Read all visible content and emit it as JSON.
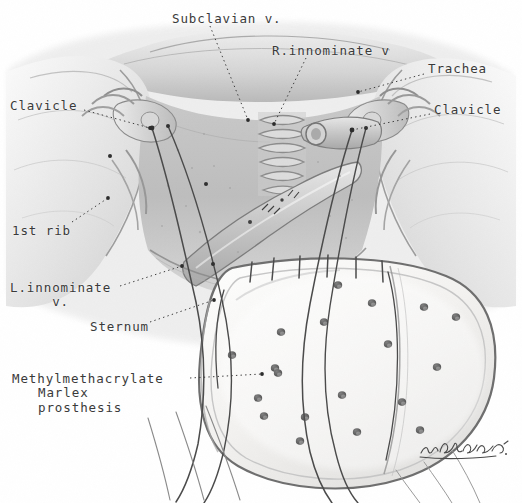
{
  "figure": {
    "medium": "grayscale pencil medical illustration",
    "background_color": "#ffffff",
    "ink_color": "#3a3a3a"
  },
  "labels": [
    {
      "id": "subclavian-v",
      "text": "Subclavian v.",
      "x": 172,
      "y": 12,
      "align": "left"
    },
    {
      "id": "r-innominate-v",
      "text": "R.innominate v",
      "x": 272,
      "y": 44,
      "align": "left"
    },
    {
      "id": "trachea",
      "text": "Trachea",
      "x": 428,
      "y": 62,
      "align": "left"
    },
    {
      "id": "clavicle-left",
      "text": "Clavicle",
      "x": 10,
      "y": 99,
      "align": "left"
    },
    {
      "id": "clavicle-right",
      "text": "Clavicle",
      "x": 434,
      "y": 103,
      "align": "left"
    },
    {
      "id": "first-rib",
      "text": "1st rib",
      "x": 12,
      "y": 224,
      "align": "left"
    },
    {
      "id": "l-innominate-v",
      "text": "L.innominate\n     v.",
      "x": 10,
      "y": 281,
      "align": "left"
    },
    {
      "id": "sternum",
      "text": "Sternum",
      "x": 90,
      "y": 320,
      "align": "left"
    },
    {
      "id": "prosthesis",
      "text": "Methylmethacrylate\n   Marlex\n   prosthesis",
      "x": 12,
      "y": 372,
      "align": "left"
    }
  ],
  "label_text": {
    "subclavian_v": "Subclavian v.",
    "r_innominate_v": "R.innominate v",
    "trachea": "Trachea",
    "clavicle_left": "Clavicle",
    "clavicle_right": "Clavicle",
    "first_rib": "1st rib",
    "l_innominate_v_line1": "L.innominate",
    "l_innominate_v_line2": "v.",
    "sternum": "Sternum",
    "prosthesis_line1": "Methylmethacrylate",
    "prosthesis_line2": "Marlex",
    "prosthesis_line3": "prosthesis"
  },
  "leader_lines": [
    {
      "id": "subclavian-leader",
      "from": [
        210,
        26
      ],
      "to": [
        248,
        120
      ],
      "style": "dotted"
    },
    {
      "id": "innominate-leader",
      "from": [
        306,
        58
      ],
      "to": [
        274,
        124
      ],
      "style": "dotted"
    },
    {
      "id": "trachea-leader",
      "from": [
        424,
        74
      ],
      "to": [
        358,
        92
      ],
      "style": "dotted"
    },
    {
      "id": "clavicle-left-leader",
      "from": [
        84,
        110
      ],
      "to": [
        150,
        128
      ],
      "style": "dotted"
    },
    {
      "id": "clavicle-right-leader",
      "from": [
        430,
        114
      ],
      "to": [
        352,
        130
      ],
      "style": "dotted"
    },
    {
      "id": "first-rib-leader",
      "from": [
        72,
        222
      ],
      "to": [
        108,
        198
      ],
      "style": "dotted"
    },
    {
      "id": "l-innominate-leader",
      "from": [
        120,
        286
      ],
      "to": [
        182,
        266
      ],
      "style": "dotted"
    },
    {
      "id": "sternum-leader",
      "from": [
        150,
        322
      ],
      "to": [
        214,
        300
      ],
      "style": "dotted"
    },
    {
      "id": "prosthesis-leader",
      "from": [
        190,
        378
      ],
      "to": [
        262,
        374
      ],
      "style": "dotted"
    }
  ],
  "prosthesis": {
    "shape": "rounded rectangle patch",
    "fill_color": "#f2f1ef",
    "edge_color": "#6e6e6e",
    "perforation_color": "#5a5a5a",
    "perforation_count": 19,
    "perforations": [
      [
        338,
        285
      ],
      [
        372,
        303
      ],
      [
        424,
        307
      ],
      [
        324,
        322
      ],
      [
        281,
        332
      ],
      [
        388,
        344
      ],
      [
        437,
        367
      ],
      [
        275,
        368
      ],
      [
        278,
        373
      ],
      [
        342,
        395
      ],
      [
        402,
        402
      ],
      [
        258,
        398
      ],
      [
        456,
        317
      ],
      [
        264,
        416
      ],
      [
        305,
        417
      ],
      [
        357,
        432
      ],
      [
        300,
        441
      ],
      [
        420,
        430
      ],
      [
        232,
        355
      ]
    ]
  },
  "sutures": {
    "thread_color": "#4a4a4a",
    "count_top_stitches": 6,
    "count_long_threads": 6
  },
  "signature": {
    "present": true,
    "style": "cursive handwriting",
    "color": "#4a4a4a"
  }
}
